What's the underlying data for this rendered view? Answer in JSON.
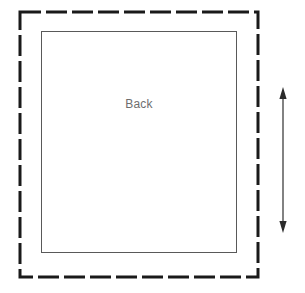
{
  "diagram": {
    "background_color": "#ffffff",
    "width": 305,
    "height": 293,
    "labels": {
      "panel": "Back"
    },
    "shapes": {
      "cut_line": {
        "name": "cutting-line",
        "style": "dashed",
        "color": "#1a1a1a",
        "stroke_width": 3,
        "dash": "21 5",
        "x": 20,
        "y": 12,
        "width": 238,
        "height": 265
      },
      "seam_line": {
        "name": "seam-line",
        "style": "solid",
        "color": "#595959",
        "stroke_width": 1,
        "x": 41,
        "y": 31,
        "width": 196,
        "height": 222
      },
      "dimension_arrow": {
        "name": "height-dimension-arrow",
        "orientation": "vertical",
        "color": "#4d4d4d",
        "stroke_width": 1.4,
        "x": 283,
        "y_top": 88,
        "y_bottom": 232,
        "arrowhead_width": 7,
        "arrowhead_height": 11,
        "double_headed": true
      }
    }
  }
}
